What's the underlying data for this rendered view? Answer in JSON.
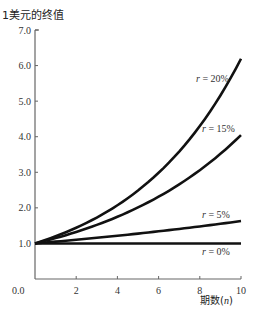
{
  "chart_data": {
    "type": "line",
    "title": "",
    "ylabel": "1美元的终值",
    "xlabel": "期数",
    "xlabel_var": "n",
    "xlim": [
      0,
      10
    ],
    "ylim": [
      0,
      7
    ],
    "xticks": [
      0,
      2,
      4,
      6,
      8,
      10
    ],
    "xtick_labels": [
      "0.0",
      "2",
      "4",
      "6",
      "8",
      "10"
    ],
    "yticks": [
      1,
      2,
      3,
      4,
      5,
      6,
      7
    ],
    "ytick_labels": [
      "1.0",
      "2.0",
      "3.0",
      "4.0",
      "5.0",
      "6.0",
      "7.0"
    ],
    "grid": false,
    "legend": "inline labels",
    "x": [
      0,
      1,
      2,
      3,
      4,
      5,
      6,
      7,
      8,
      9,
      10
    ],
    "series": [
      {
        "name": "r = 20%",
        "rate": 0.2,
        "values": [
          1.0,
          1.2,
          1.44,
          1.73,
          2.07,
          2.49,
          2.99,
          3.58,
          4.3,
          5.16,
          6.19
        ]
      },
      {
        "name": "r = 15%",
        "rate": 0.15,
        "values": [
          1.0,
          1.15,
          1.32,
          1.52,
          1.75,
          2.01,
          2.31,
          2.66,
          3.06,
          3.52,
          4.05
        ]
      },
      {
        "name": "r = 5%",
        "rate": 0.05,
        "values": [
          1.0,
          1.05,
          1.1,
          1.16,
          1.22,
          1.28,
          1.34,
          1.41,
          1.48,
          1.55,
          1.63
        ]
      },
      {
        "name": "r = 0%",
        "rate": 0.0,
        "values": [
          1.0,
          1.0,
          1.0,
          1.0,
          1.0,
          1.0,
          1.0,
          1.0,
          1.0,
          1.0,
          1.0
        ]
      }
    ]
  },
  "labels": {
    "ylabel": "1美元的终值",
    "xlabel_text": "期数",
    "xlabel_var": "n",
    "series": [
      "r = 20%",
      "r = 15%",
      "r = 5%",
      "r = 0%"
    ]
  }
}
